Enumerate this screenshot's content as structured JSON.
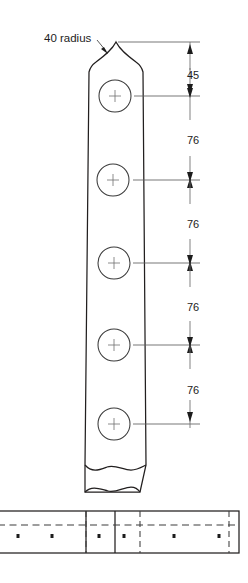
{
  "drawing": {
    "title": "Fence post elevation detail",
    "background_color": "#ffffff",
    "line_color": "#221f1f",
    "dimension_color": "#6a6a6a",
    "hidden_line_color": "#3d3d3d",
    "notes": [
      {
        "id": "radius-note",
        "text": "40 radius",
        "x": 44,
        "y": 42,
        "leader_from_x": 97,
        "leader_from_y": 40,
        "leader_to_x": 107,
        "leader_to_y": 53
      }
    ],
    "dimensions": [
      {
        "id": "dim-45",
        "label": "45",
        "value": 45,
        "text_x": 193,
        "text_y": 79,
        "top_y": 42,
        "bottom_y": 96
      },
      {
        "id": "dim-76-1",
        "label": "76",
        "value": 76,
        "text_x": 193,
        "text_y": 144,
        "top_y": 96,
        "bottom_y": 180
      },
      {
        "id": "dim-76-2",
        "label": "76",
        "value": 76,
        "text_x": 193,
        "text_y": 228,
        "top_y": 180,
        "bottom_y": 263
      },
      {
        "id": "dim-76-3",
        "label": "76",
        "value": 76,
        "text_x": 193,
        "text_y": 311,
        "top_y": 263,
        "bottom_y": 345
      },
      {
        "id": "dim-76-4",
        "label": "76",
        "value": 76,
        "text_x": 193,
        "text_y": 394,
        "top_y": 345,
        "bottom_y": 424
      }
    ],
    "dimension_line_x": 190,
    "holes": [
      {
        "id": "hole-1",
        "cx": 115,
        "cy": 96,
        "r": 16
      },
      {
        "id": "hole-2",
        "cx": 113,
        "cy": 180,
        "r": 16
      },
      {
        "id": "hole-3",
        "cx": 114,
        "cy": 263,
        "r": 16
      },
      {
        "id": "hole-4",
        "cx": 114,
        "cy": 345,
        "r": 16
      },
      {
        "id": "hole-5",
        "cx": 114,
        "cy": 424,
        "r": 16
      }
    ],
    "post": {
      "apex_x": 116,
      "apex_y": 42,
      "shoulder_left_x": 89,
      "shoulder_right_x": 143,
      "shoulder_y": 72,
      "base_left_x": 85,
      "base_right_x": 146,
      "break_y": 465
    },
    "rail": {
      "left_x": 0,
      "right_x": 239,
      "top_y": 511,
      "bottom_y": 553,
      "center_dash_y": 525,
      "joint_lines_x": [
        86,
        115
      ],
      "hidden_vertical_x": [
        86,
        140,
        229
      ],
      "dots": [
        {
          "cx": 18,
          "cy": 536
        },
        {
          "cx": 52,
          "cy": 536
        },
        {
          "cx": 99,
          "cy": 536
        },
        {
          "cx": 124,
          "cy": 536
        },
        {
          "cx": 174,
          "cy": 536
        },
        {
          "cx": 219,
          "cy": 536
        }
      ]
    },
    "break_lines": [
      {
        "id": "post-break-upper",
        "y": 465,
        "left_x": 85,
        "right_x": 146
      },
      {
        "id": "post-break-lower",
        "y": 492,
        "left_x": 85,
        "right_x": 140
      }
    ]
  }
}
